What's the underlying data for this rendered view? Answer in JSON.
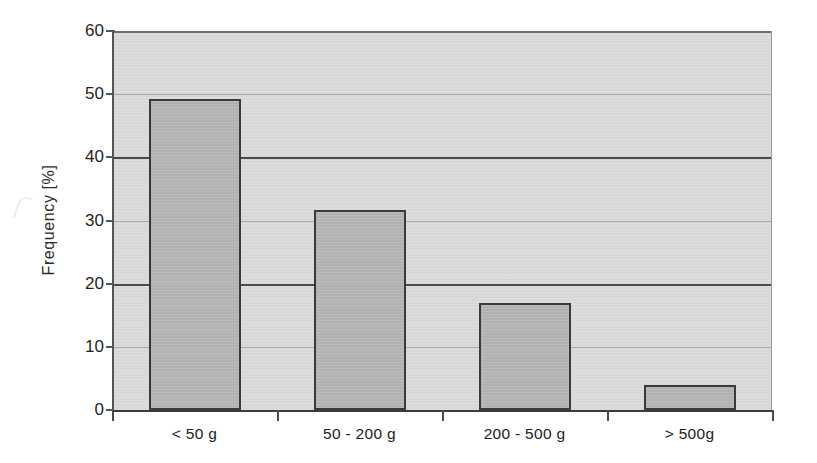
{
  "chart_data": {
    "type": "bar",
    "title": "",
    "xlabel": "",
    "ylabel": "Frequency [%]",
    "categories": [
      "< 50 g",
      "50 - 200 g",
      "200 - 500 g",
      "> 500g"
    ],
    "values": [
      49.2,
      31.7,
      17.0,
      4.0
    ],
    "ylim": [
      0,
      60
    ],
    "yticks": [
      0,
      10,
      20,
      30,
      40,
      50,
      60
    ],
    "ytick_labels": [
      "0",
      "10",
      "20",
      "30",
      "40",
      "50",
      "60"
    ],
    "grid": true,
    "gridlines_major": [
      0,
      20,
      40,
      60
    ],
    "gridlines_minor": [
      10,
      30,
      50
    ],
    "legend": null,
    "legend_position": "none",
    "bar_color": "#b2b2b2",
    "bar_edge_color": "#3a3a3a",
    "plot_background": "#d9d9d9",
    "figure_background": "#ffffff",
    "axis_color": "#3b3b3b",
    "gridline_color": "#a9a9a9"
  },
  "axes": {
    "y_title": "Frequency [%]"
  }
}
